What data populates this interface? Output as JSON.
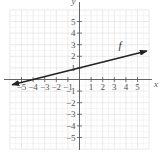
{
  "chart_data": {
    "type": "line",
    "title": "",
    "xlabel": "x",
    "ylabel": "y",
    "xlim": [
      -6,
      6
    ],
    "ylim": [
      -6,
      6
    ],
    "grid": true,
    "x_ticks": [
      -5,
      -4,
      -3,
      -2,
      -1,
      1,
      2,
      3,
      4,
      5
    ],
    "y_ticks": [
      -5,
      -4,
      -3,
      -2,
      -1,
      1,
      2,
      3,
      4,
      5
    ],
    "x_tick_labels": [
      "−5",
      "−4",
      "−3",
      "−2",
      "−1",
      "1",
      "2",
      "3",
      "4",
      "5"
    ],
    "y_tick_labels": [
      "−5",
      "−4",
      "−3",
      "−2",
      "−1",
      "1",
      "2",
      "3",
      "4",
      "5"
    ],
    "series": [
      {
        "name": "f",
        "equation": "f(x) = x/4 + 1",
        "slope": 0.25,
        "intercept": 1,
        "x": [
          -5.8,
          -4,
          0,
          4,
          5.8
        ],
        "y": [
          -0.45,
          0,
          1,
          2,
          2.45
        ],
        "arrows": "both"
      }
    ],
    "annotations": [
      {
        "text": "f",
        "x": 3.5,
        "y": 2.6
      }
    ]
  },
  "labels": {
    "x_axis": "x",
    "y_axis": "y",
    "function": "f"
  },
  "colors": {
    "grid": "#e6e6e6",
    "axis": "#555555",
    "line": "#222222",
    "text": "#555555"
  }
}
